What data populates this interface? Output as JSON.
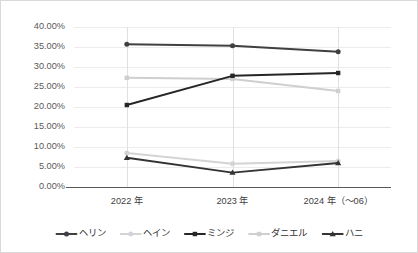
{
  "chart_data": {
    "type": "line",
    "title": "",
    "xlabel": "",
    "ylabel": "",
    "categories": [
      "2022 年",
      "2023 年",
      "2024 年（～06）"
    ],
    "ylim": [
      0,
      40
    ],
    "ytick_labels": [
      "40.00%",
      "35.00%",
      "30.00%",
      "25.00%",
      "20.00%",
      "15.00%",
      "10.00%",
      "5.00%",
      "0.00%"
    ],
    "ytick_values": [
      40,
      35,
      30,
      25,
      20,
      15,
      10,
      5,
      0
    ],
    "grid": true,
    "legend_position": "bottom",
    "series": [
      {
        "name": "ヘリン",
        "values": [
          35.7,
          35.3,
          33.8
        ],
        "color": "#404040",
        "marker": "circle"
      },
      {
        "name": "ヘイン",
        "values": [
          8.5,
          5.8,
          6.5
        ],
        "color": "#d4d4d4",
        "marker": "circle"
      },
      {
        "name": "ミンジ",
        "values": [
          20.5,
          27.8,
          28.5
        ],
        "color": "#262626",
        "marker": "square"
      },
      {
        "name": "ダニエル",
        "values": [
          27.3,
          27.0,
          24.0
        ],
        "color": "#cfcfcf",
        "marker": "square"
      },
      {
        "name": "ハニ",
        "values": [
          7.3,
          3.6,
          6.0
        ],
        "color": "#333333",
        "marker": "triangle"
      }
    ]
  }
}
